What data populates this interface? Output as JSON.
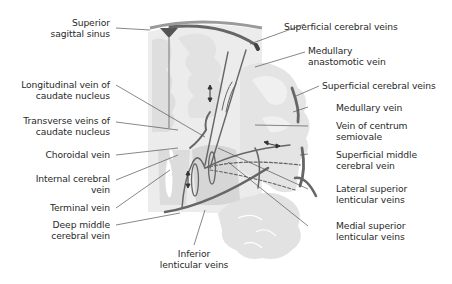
{
  "diagram": {
    "colors": {
      "vein": "#6b6b6b",
      "vein_dark": "#4a4a4a",
      "tissue": "#e6e6e6",
      "tissue_light": "#f2f2f2",
      "leader_line": "#555555",
      "text": "#2a2a2a"
    },
    "labels_left": [
      {
        "id": "superior-sagittal-sinus",
        "lines": [
          "Superior",
          "sagittal sinus"
        ]
      },
      {
        "id": "longitudinal-vein-caudate",
        "lines": [
          "Longitudinal vein of",
          "caudate nucleus"
        ]
      },
      {
        "id": "transverse-veins-caudate",
        "lines": [
          "Transverse veins of",
          "caudate nucleus"
        ]
      },
      {
        "id": "choroidal-vein",
        "lines": [
          "Choroidal vein"
        ]
      },
      {
        "id": "internal-cerebral-vein",
        "lines": [
          "Internal cerebral",
          "vein"
        ]
      },
      {
        "id": "terminal-vein",
        "lines": [
          "Terminal vein"
        ]
      },
      {
        "id": "deep-middle-cerebral-vein",
        "lines": [
          "Deep middle",
          "cerebral vein"
        ]
      }
    ],
    "labels_right": [
      {
        "id": "superficial-cerebral-veins-top",
        "lines": [
          "Superficial cerebral veins"
        ]
      },
      {
        "id": "medullary-anastomotic-vein",
        "lines": [
          "Medullary",
          "anastomotic vein"
        ]
      },
      {
        "id": "superficial-cerebral-veins-mid",
        "lines": [
          "Superficial cerebral veins"
        ]
      },
      {
        "id": "medullary-vein",
        "lines": [
          "Medullary vein"
        ]
      },
      {
        "id": "vein-centrum-semiovale",
        "lines": [
          "Vein of centrum",
          "semiovale"
        ]
      },
      {
        "id": "superficial-middle-cerebral-vein",
        "lines": [
          "Superficial middle",
          "cerebral vein"
        ]
      },
      {
        "id": "lateral-superior-lenticular-veins",
        "lines": [
          "Lateral superior",
          "lenticular veins"
        ]
      },
      {
        "id": "medial-superior-lenticular-veins",
        "lines": [
          "Medial superior",
          "lenticular veins"
        ]
      }
    ],
    "labels_bottom": [
      {
        "id": "inferior-lenticular-veins",
        "lines": [
          "Inferior",
          "lenticular veins"
        ]
      }
    ]
  }
}
